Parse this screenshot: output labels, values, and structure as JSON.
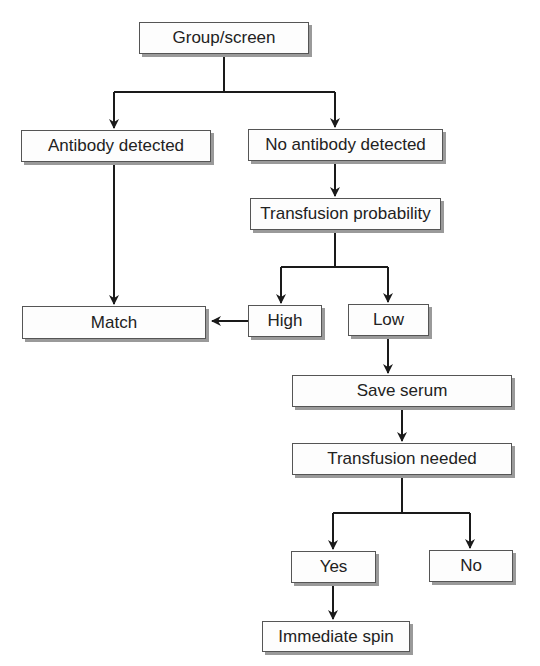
{
  "diagram": {
    "type": "flowchart",
    "nodes": {
      "group_screen": "Group/screen",
      "antibody_detected": "Antibody detected",
      "no_antibody_detected": "No antibody detected",
      "transfusion_probability": "Transfusion probability",
      "match": "Match",
      "high": "High",
      "low": "Low",
      "save_serum": "Save serum",
      "transfusion_needed": "Transfusion needed",
      "yes": "Yes",
      "no": "No",
      "immediate_spin": "Immediate spin"
    },
    "edges": [
      {
        "from": "Group/screen",
        "to": "Antibody detected"
      },
      {
        "from": "Group/screen",
        "to": "No antibody detected"
      },
      {
        "from": "Antibody detected",
        "to": "Match"
      },
      {
        "from": "No antibody detected",
        "to": "Transfusion probability"
      },
      {
        "from": "Transfusion probability",
        "to": "High"
      },
      {
        "from": "Transfusion probability",
        "to": "Low"
      },
      {
        "from": "High",
        "to": "Match"
      },
      {
        "from": "Low",
        "to": "Save serum"
      },
      {
        "from": "Save serum",
        "to": "Transfusion needed"
      },
      {
        "from": "Transfusion needed",
        "to": "Yes"
      },
      {
        "from": "Transfusion needed",
        "to": "No"
      },
      {
        "from": "Yes",
        "to": "Immediate spin"
      }
    ],
    "colors": {
      "line": "#1a1a1a",
      "box_border": "#555555",
      "box_shadow": "#9a9a9a",
      "text": "#222222"
    }
  }
}
